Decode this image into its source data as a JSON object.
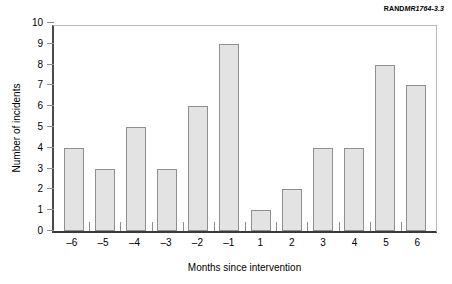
{
  "credit": {
    "organization": "RAND",
    "document_number": "MR1764-3.3"
  },
  "chart_data": {
    "type": "bar",
    "title": "",
    "xlabel": "Months since intervention",
    "ylabel": "Number of incidents",
    "categories": [
      "–6",
      "–5",
      "–4",
      "–3",
      "–2",
      "–1",
      "1",
      "2",
      "3",
      "4",
      "5",
      "6"
    ],
    "values": [
      4,
      3,
      5,
      3,
      6,
      9,
      1,
      2,
      4,
      4,
      8,
      7
    ],
    "ylim": [
      0,
      10
    ],
    "yticks": [
      "0",
      "1",
      "2",
      "3",
      "4",
      "5",
      "6",
      "7",
      "8",
      "9",
      "10"
    ],
    "grid": false,
    "legend": null,
    "bar_fill_color": "#e3e3e3",
    "bar_border_color": "#8f8f8f",
    "axis_color": "#3a3a3a",
    "background_color": "#ffffff"
  }
}
